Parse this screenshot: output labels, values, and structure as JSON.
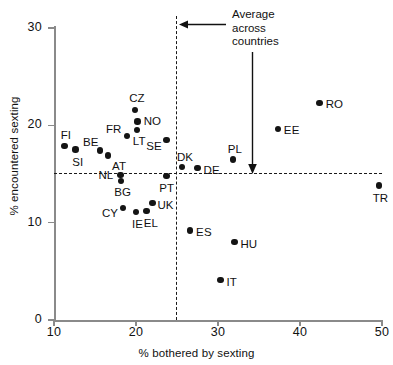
{
  "chart_data": {
    "type": "scatter",
    "title": "",
    "xlabel": "% bothered by sexting",
    "ylabel": "% encountered sexting",
    "xlim": [
      10,
      50
    ],
    "ylim": [
      0,
      30
    ],
    "xticks": [
      10,
      20,
      30,
      40,
      50
    ],
    "yticks": [
      0,
      10,
      20,
      30
    ],
    "grid": false,
    "legend": null,
    "annotations": [
      {
        "name": "average-across-countries",
        "lines": [
          "Average",
          "across",
          "countries"
        ],
        "text": "Average across countries",
        "arrows": [
          "left-to-vertical-average-line",
          "down-to-horizontal-average-line"
        ]
      }
    ],
    "reference_lines": [
      {
        "name": "average-x",
        "orientation": "vertical",
        "value": 25
      },
      {
        "name": "average-y",
        "orientation": "horizontal",
        "value": 15
      }
    ],
    "points": [
      {
        "label": "FI",
        "x": 11.3,
        "y": 17.9,
        "lx": -4,
        "ly": -16
      },
      {
        "label": "SI",
        "x": 12.6,
        "y": 17.5,
        "lx": -3,
        "ly": 7
      },
      {
        "label": "BE",
        "x": 15.6,
        "y": 17.4,
        "lx": -17,
        "ly": -14
      },
      {
        "label": "AT",
        "x": 16.6,
        "y": 16.9,
        "lx": 4,
        "ly": 5
      },
      {
        "label": "FR",
        "x": 18.9,
        "y": 18.9,
        "lx": -21,
        "ly": -12
      },
      {
        "label": "CZ",
        "x": 19.9,
        "y": 21.6,
        "lx": -6,
        "ly": -17
      },
      {
        "label": "NO",
        "x": 20.2,
        "y": 20.4,
        "lx": 6,
        "ly": -5
      },
      {
        "label": "LT",
        "x": 20.1,
        "y": 19.5,
        "lx": -4,
        "ly": 6
      },
      {
        "label": "SE",
        "x": 23.7,
        "y": 18.5,
        "lx": -20,
        "ly": 1
      },
      {
        "label": "NL",
        "x": 18.1,
        "y": 14.9,
        "lx": -22,
        "ly": -5
      },
      {
        "label": "BG",
        "x": 18.2,
        "y": 14.3,
        "lx": -7,
        "ly": 6
      },
      {
        "label": "PT",
        "x": 23.7,
        "y": 14.8,
        "lx": -7,
        "ly": 7
      },
      {
        "label": "DK",
        "x": 25.6,
        "y": 15.7,
        "lx": -5,
        "ly": -15
      },
      {
        "label": "DE",
        "x": 27.5,
        "y": 15.6,
        "lx": 6,
        "ly": -3
      },
      {
        "label": "PL",
        "x": 31.8,
        "y": 16.5,
        "lx": -5,
        "ly": -15
      },
      {
        "label": "EE",
        "x": 37.3,
        "y": 19.6,
        "lx": 6,
        "ly": -4
      },
      {
        "label": "RO",
        "x": 42.4,
        "y": 22.3,
        "lx": 6,
        "ly": -4
      },
      {
        "label": "TR",
        "x": 49.6,
        "y": 13.8,
        "lx": -6,
        "ly": 7
      },
      {
        "label": "UK",
        "x": 22.0,
        "y": 12.0,
        "lx": 5,
        "ly": -3
      },
      {
        "label": "CY",
        "x": 18.4,
        "y": 11.5,
        "lx": -21,
        "ly": 0
      },
      {
        "label": "IE",
        "x": 20.0,
        "y": 11.1,
        "lx": -4,
        "ly": 7
      },
      {
        "label": "EL",
        "x": 21.3,
        "y": 11.2,
        "lx": -3,
        "ly": 7
      },
      {
        "label": "ES",
        "x": 26.6,
        "y": 9.2,
        "lx": 6,
        "ly": -3
      },
      {
        "label": "HU",
        "x": 32.0,
        "y": 8.0,
        "lx": 6,
        "ly": -3
      },
      {
        "label": "IT",
        "x": 30.3,
        "y": 4.1,
        "lx": 6,
        "ly": -3
      }
    ]
  }
}
